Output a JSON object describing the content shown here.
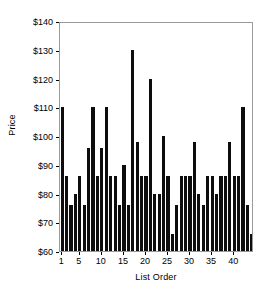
{
  "chart_data": {
    "type": "bar",
    "title": "",
    "subtitle": "",
    "xlabel": "List Order",
    "ylabel": "Price",
    "ylim": [
      60,
      140
    ],
    "xlim": [
      0.5,
      44.5
    ],
    "grid": false,
    "legend": null,
    "bar_color": "#0d0d0d",
    "frame_color": "#9a9a9a",
    "y_tick_labels": [
      "$60",
      "$70",
      "$80",
      "$90",
      "$100",
      "$110",
      "$120",
      "$130",
      "$140"
    ],
    "y_tick_values": [
      60,
      70,
      80,
      90,
      100,
      110,
      120,
      130,
      140
    ],
    "x_tick_labels": [
      "1",
      "5",
      "10",
      "15",
      "20",
      "25",
      "30",
      "35",
      "40"
    ],
    "x_tick_values": [
      1,
      5,
      10,
      15,
      20,
      25,
      30,
      35,
      40
    ],
    "categories": [
      1,
      2,
      3,
      4,
      5,
      6,
      7,
      8,
      9,
      10,
      11,
      12,
      13,
      14,
      15,
      16,
      17,
      18,
      19,
      20,
      21,
      22,
      23,
      24,
      25,
      26,
      27,
      28,
      29,
      30,
      31,
      32,
      33,
      34,
      35,
      36,
      37,
      38,
      39,
      40,
      41,
      42,
      43,
      44
    ],
    "values": [
      110,
      86,
      76,
      80,
      86,
      76,
      96,
      110,
      86,
      96,
      110,
      86,
      86,
      76,
      90,
      76,
      130,
      98,
      86,
      86,
      120,
      80,
      80,
      100,
      86,
      66,
      76,
      86,
      86,
      86,
      98,
      80,
      76,
      86,
      86,
      80,
      86,
      86,
      98,
      86,
      86,
      110,
      76,
      66
    ]
  }
}
